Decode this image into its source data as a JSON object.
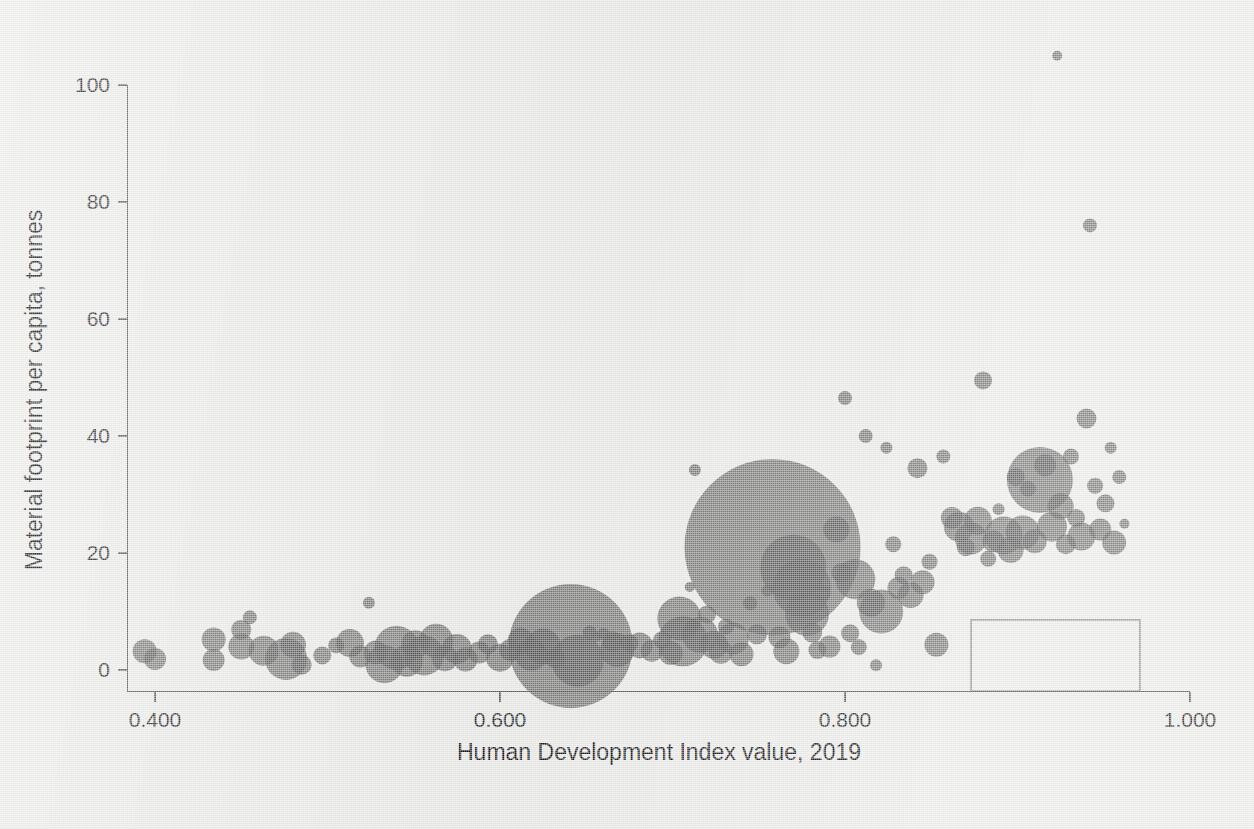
{
  "chart_data": {
    "type": "scatter",
    "title": "",
    "xlabel": "Human Development Index value, 2019",
    "ylabel": "Material footprint per capita, tonnes",
    "xlim": [
      0.385,
      1.005
    ],
    "ylim": [
      -4,
      107
    ],
    "xticks": [
      "0.400",
      "0.600",
      "0.800",
      "1.000"
    ],
    "xtick_values": [
      0.4,
      0.6,
      0.8,
      1.0
    ],
    "yticks": [
      "0",
      "20",
      "40",
      "60",
      "80",
      "100"
    ],
    "ytick_values": [
      0,
      20,
      40,
      60,
      80,
      100
    ],
    "grid": false,
    "legend": "none",
    "bubble_encoding": "population",
    "marker_color": "#4d4d4d",
    "marker_opacity": 0.72,
    "background_color": "#ebebe9",
    "points": [
      {
        "x": 0.394,
        "y": 3.2,
        "r": 12
      },
      {
        "x": 0.4,
        "y": 1.9,
        "r": 11
      },
      {
        "x": 0.434,
        "y": 5.2,
        "r": 12
      },
      {
        "x": 0.434,
        "y": 1.7,
        "r": 11
      },
      {
        "x": 0.45,
        "y": 6.9,
        "r": 10
      },
      {
        "x": 0.455,
        "y": 9.0,
        "r": 7
      },
      {
        "x": 0.45,
        "y": 4.0,
        "r": 13
      },
      {
        "x": 0.463,
        "y": 3.3,
        "r": 15
      },
      {
        "x": 0.476,
        "y": 1.9,
        "r": 21
      },
      {
        "x": 0.48,
        "y": 4.3,
        "r": 13
      },
      {
        "x": 0.485,
        "y": 0.9,
        "r": 10
      },
      {
        "x": 0.497,
        "y": 2.5,
        "r": 9
      },
      {
        "x": 0.505,
        "y": 4.2,
        "r": 8
      },
      {
        "x": 0.513,
        "y": 4.6,
        "r": 14
      },
      {
        "x": 0.519,
        "y": 2.3,
        "r": 11
      },
      {
        "x": 0.524,
        "y": 11.5,
        "r": 6
      },
      {
        "x": 0.528,
        "y": 3.0,
        "r": 12
      },
      {
        "x": 0.533,
        "y": 1.0,
        "r": 19
      },
      {
        "x": 0.54,
        "y": 3.8,
        "r": 22
      },
      {
        "x": 0.546,
        "y": 1.6,
        "r": 16
      },
      {
        "x": 0.551,
        "y": 4.4,
        "r": 14
      },
      {
        "x": 0.556,
        "y": 2.5,
        "r": 20
      },
      {
        "x": 0.563,
        "y": 5.0,
        "r": 17
      },
      {
        "x": 0.568,
        "y": 2.0,
        "r": 13
      },
      {
        "x": 0.575,
        "y": 3.6,
        "r": 15
      },
      {
        "x": 0.58,
        "y": 1.8,
        "r": 12
      },
      {
        "x": 0.588,
        "y": 3.0,
        "r": 11
      },
      {
        "x": 0.593,
        "y": 4.4,
        "r": 10
      },
      {
        "x": 0.6,
        "y": 2.1,
        "r": 14
      },
      {
        "x": 0.606,
        "y": 3.4,
        "r": 11
      },
      {
        "x": 0.612,
        "y": 5.0,
        "r": 13
      },
      {
        "x": 0.618,
        "y": 2.6,
        "r": 16
      },
      {
        "x": 0.625,
        "y": 4.0,
        "r": 18
      },
      {
        "x": 0.632,
        "y": 2.0,
        "r": 10
      },
      {
        "x": 0.641,
        "y": 4.1,
        "r": 62
      },
      {
        "x": 0.645,
        "y": 1.6,
        "r": 26
      },
      {
        "x": 0.652,
        "y": 6.4,
        "r": 7
      },
      {
        "x": 0.656,
        "y": 5.7,
        "r": 5
      },
      {
        "x": 0.66,
        "y": 6.2,
        "r": 6
      },
      {
        "x": 0.665,
        "y": 4.9,
        "r": 10
      },
      {
        "x": 0.668,
        "y": 3.4,
        "r": 17
      },
      {
        "x": 0.675,
        "y": 4.6,
        "r": 9
      },
      {
        "x": 0.681,
        "y": 4.2,
        "r": 13
      },
      {
        "x": 0.688,
        "y": 3.3,
        "r": 11
      },
      {
        "x": 0.694,
        "y": 5.1,
        "r": 9
      },
      {
        "x": 0.699,
        "y": 2.9,
        "r": 12
      },
      {
        "x": 0.704,
        "y": 8.8,
        "r": 22
      },
      {
        "x": 0.706,
        "y": 4.9,
        "r": 25
      },
      {
        "x": 0.71,
        "y": 14.2,
        "r": 5
      },
      {
        "x": 0.713,
        "y": 34.2,
        "r": 6
      },
      {
        "x": 0.716,
        "y": 6.0,
        "r": 18
      },
      {
        "x": 0.72,
        "y": 9.5,
        "r": 9
      },
      {
        "x": 0.724,
        "y": 4.3,
        "r": 14
      },
      {
        "x": 0.728,
        "y": 3.1,
        "r": 12
      },
      {
        "x": 0.731,
        "y": 7.4,
        "r": 8
      },
      {
        "x": 0.735,
        "y": 5.4,
        "r": 16
      },
      {
        "x": 0.74,
        "y": 2.7,
        "r": 12
      },
      {
        "x": 0.745,
        "y": 11.4,
        "r": 7
      },
      {
        "x": 0.749,
        "y": 6.1,
        "r": 10
      },
      {
        "x": 0.755,
        "y": 13.6,
        "r": 6
      },
      {
        "x": 0.758,
        "y": 21.0,
        "r": 88
      },
      {
        "x": 0.762,
        "y": 5.6,
        "r": 11
      },
      {
        "x": 0.766,
        "y": 3.2,
        "r": 13
      },
      {
        "x": 0.77,
        "y": 17.5,
        "r": 33
      },
      {
        "x": 0.775,
        "y": 14.0,
        "r": 29
      },
      {
        "x": 0.778,
        "y": 9.6,
        "r": 22
      },
      {
        "x": 0.781,
        "y": 6.4,
        "r": 10
      },
      {
        "x": 0.784,
        "y": 3.4,
        "r": 9
      },
      {
        "x": 0.787,
        "y": 13.1,
        "r": 8
      },
      {
        "x": 0.791,
        "y": 4.0,
        "r": 11
      },
      {
        "x": 0.795,
        "y": 24.0,
        "r": 13
      },
      {
        "x": 0.798,
        "y": 16.6,
        "r": 10
      },
      {
        "x": 0.8,
        "y": 46.5,
        "r": 7
      },
      {
        "x": 0.803,
        "y": 6.3,
        "r": 9
      },
      {
        "x": 0.806,
        "y": 15.5,
        "r": 20
      },
      {
        "x": 0.808,
        "y": 3.9,
        "r": 8
      },
      {
        "x": 0.812,
        "y": 40.0,
        "r": 7
      },
      {
        "x": 0.815,
        "y": 11.5,
        "r": 14
      },
      {
        "x": 0.818,
        "y": 0.8,
        "r": 6
      },
      {
        "x": 0.821,
        "y": 10.0,
        "r": 22
      },
      {
        "x": 0.824,
        "y": 38.0,
        "r": 6
      },
      {
        "x": 0.828,
        "y": 21.5,
        "r": 8
      },
      {
        "x": 0.831,
        "y": 14.0,
        "r": 11
      },
      {
        "x": 0.834,
        "y": 16.2,
        "r": 9
      },
      {
        "x": 0.838,
        "y": 12.8,
        "r": 13
      },
      {
        "x": 0.842,
        "y": 34.5,
        "r": 10
      },
      {
        "x": 0.845,
        "y": 15.0,
        "r": 12
      },
      {
        "x": 0.849,
        "y": 18.5,
        "r": 8
      },
      {
        "x": 0.853,
        "y": 4.3,
        "r": 12
      },
      {
        "x": 0.857,
        "y": 36.5,
        "r": 7
      },
      {
        "x": 0.862,
        "y": 26.0,
        "r": 11
      },
      {
        "x": 0.866,
        "y": 24.5,
        "r": 15
      },
      {
        "x": 0.87,
        "y": 21.0,
        "r": 9
      },
      {
        "x": 0.873,
        "y": 22.5,
        "r": 16
      },
      {
        "x": 0.877,
        "y": 25.5,
        "r": 14
      },
      {
        "x": 0.88,
        "y": 49.5,
        "r": 9
      },
      {
        "x": 0.883,
        "y": 19.0,
        "r": 8
      },
      {
        "x": 0.886,
        "y": 22.0,
        "r": 11
      },
      {
        "x": 0.889,
        "y": 27.5,
        "r": 6
      },
      {
        "x": 0.892,
        "y": 23.0,
        "r": 19
      },
      {
        "x": 0.896,
        "y": 20.5,
        "r": 13
      },
      {
        "x": 0.899,
        "y": 33.0,
        "r": 9
      },
      {
        "x": 0.903,
        "y": 23.5,
        "r": 17
      },
      {
        "x": 0.906,
        "y": 31.0,
        "r": 8
      },
      {
        "x": 0.91,
        "y": 22.0,
        "r": 12
      },
      {
        "x": 0.913,
        "y": 32.5,
        "r": 33
      },
      {
        "x": 0.916,
        "y": 35.0,
        "r": 11
      },
      {
        "x": 0.92,
        "y": 24.5,
        "r": 15
      },
      {
        "x": 0.923,
        "y": 105.0,
        "r": 5
      },
      {
        "x": 0.925,
        "y": 28.0,
        "r": 13
      },
      {
        "x": 0.928,
        "y": 21.5,
        "r": 10
      },
      {
        "x": 0.931,
        "y": 36.5,
        "r": 8
      },
      {
        "x": 0.934,
        "y": 26.0,
        "r": 9
      },
      {
        "x": 0.937,
        "y": 22.8,
        "r": 14
      },
      {
        "x": 0.94,
        "y": 43.0,
        "r": 10
      },
      {
        "x": 0.942,
        "y": 76.0,
        "r": 7
      },
      {
        "x": 0.945,
        "y": 31.5,
        "r": 8
      },
      {
        "x": 0.948,
        "y": 24.0,
        "r": 11
      },
      {
        "x": 0.951,
        "y": 28.5,
        "r": 9
      },
      {
        "x": 0.954,
        "y": 38.0,
        "r": 6
      },
      {
        "x": 0.956,
        "y": 21.8,
        "r": 12
      },
      {
        "x": 0.959,
        "y": 33.0,
        "r": 7
      },
      {
        "x": 0.962,
        "y": 25.0,
        "r": 5
      }
    ],
    "annotations": [
      {
        "type": "empty-box",
        "x0": 0.873,
        "x1": 0.971,
        "y0": -3.5,
        "y1": 8.6
      }
    ]
  }
}
